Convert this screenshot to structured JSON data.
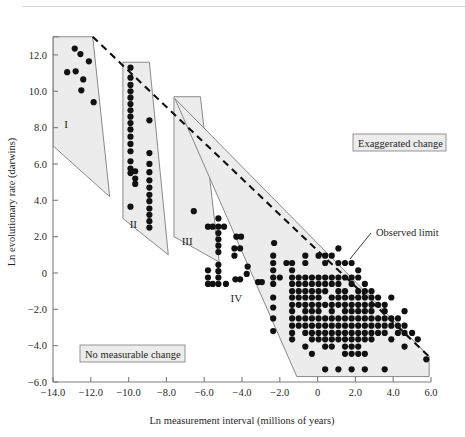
{
  "figure": {
    "name": "evolutionary-rate-vs-measurement-interval-scatter"
  },
  "chart_data": {
    "type": "scatter",
    "title": "",
    "xlabel": "Ln measurement interval (millions of years)",
    "ylabel": "Ln evolutionary rate (darwins)",
    "xlim": [
      -14.0,
      6.0
    ],
    "ylim": [
      -6.0,
      13.0
    ],
    "xticks": [
      -14.0,
      -12.0,
      -10.0,
      -8.0,
      -6.0,
      -4.0,
      -2.0,
      0,
      2.0,
      4.0,
      6.0
    ],
    "xticklabels": [
      "−14.0",
      "−12.0",
      "−10.0",
      "−8.0",
      "−6.0",
      "−4.0",
      "−2.0",
      "0",
      "2.0",
      "4.0",
      "6.0"
    ],
    "yticks": [
      -6.0,
      -4.0,
      -2.0,
      0,
      2.0,
      4.0,
      6.0,
      8.0,
      10.0,
      12.0
    ],
    "yticklabels": [
      "−6.0",
      "−4.0",
      "−2.0",
      "0",
      "2.0",
      "4.0",
      "6.0",
      "8.0",
      "10.0",
      "12.0"
    ],
    "grid": false,
    "legend": false,
    "marker": "filled-circle",
    "marker_color": "#111111",
    "marker_size": 3.1,
    "observed_limit_line": {
      "label": "Observed limit",
      "style": "dashed",
      "from": [
        -11.9,
        13.0
      ],
      "to": [
        5.9,
        -4.6
      ]
    },
    "annotations": [
      {
        "name": "exaggerated-change",
        "text": "Exaggerated change",
        "boxed": true
      },
      {
        "name": "no-measurable-change",
        "text": "No measurable change",
        "boxed": true
      },
      {
        "name": "observed-limit",
        "text": "Observed limit",
        "boxed": false
      }
    ],
    "regions": [
      {
        "label": "I",
        "fill": "#ececec",
        "polygon": [
          [
            -14.0,
            13.0
          ],
          [
            -11.9,
            13.0
          ],
          [
            -11.0,
            4.2
          ],
          [
            -14.0,
            7.0
          ]
        ]
      },
      {
        "label": "II",
        "fill": "#ececec",
        "polygon": [
          [
            -10.3,
            11.6
          ],
          [
            -8.9,
            11.6
          ],
          [
            -7.9,
            1.0
          ],
          [
            -10.3,
            3.0
          ]
        ]
      },
      {
        "label": "III",
        "fill": "#ececec",
        "polygon": [
          [
            -7.6,
            9.7
          ],
          [
            -6.2,
            9.7
          ],
          [
            -5.2,
            0.6
          ],
          [
            -7.6,
            2.0
          ]
        ]
      },
      {
        "label": "IV",
        "fill": "#ececec",
        "polygon": [
          [
            -7.55,
            9.6
          ],
          [
            5.9,
            -4.6
          ],
          [
            5.9,
            -5.7
          ],
          [
            -1.1,
            -5.7
          ]
        ]
      }
    ],
    "series": [
      {
        "name": "region I",
        "points": [
          [
            -12.85,
            12.35
          ],
          [
            -12.55,
            12.05
          ],
          [
            -12.1,
            11.65
          ],
          [
            -13.25,
            11.05
          ],
          [
            -12.8,
            11.1
          ],
          [
            -12.4,
            10.65
          ],
          [
            -12.5,
            10.05
          ],
          [
            -11.85,
            9.4
          ]
        ]
      },
      {
        "name": "region II column a",
        "points": [
          [
            -9.9,
            11.3
          ],
          [
            -9.9,
            10.75
          ],
          [
            -9.9,
            10.35
          ],
          [
            -9.9,
            10.0
          ],
          [
            -9.9,
            9.65
          ],
          [
            -9.9,
            9.3
          ],
          [
            -9.9,
            8.95
          ],
          [
            -9.9,
            8.6
          ],
          [
            -9.9,
            8.25
          ],
          [
            -9.9,
            7.9
          ],
          [
            -9.9,
            7.5
          ],
          [
            -9.9,
            7.1
          ],
          [
            -9.9,
            6.7
          ],
          [
            -9.9,
            6.15
          ],
          [
            -9.9,
            5.75
          ],
          [
            -9.9,
            5.5
          ],
          [
            -9.65,
            5.6
          ],
          [
            -9.65,
            5.2
          ],
          [
            -9.65,
            4.9
          ],
          [
            -9.9,
            3.65
          ]
        ]
      },
      {
        "name": "region II column b",
        "points": [
          [
            -8.9,
            8.4
          ],
          [
            -8.9,
            6.6
          ],
          [
            -8.9,
            6.0
          ],
          [
            -8.9,
            5.55
          ],
          [
            -8.9,
            5.1
          ],
          [
            -8.9,
            4.7
          ],
          [
            -8.9,
            4.3
          ],
          [
            -8.9,
            3.95
          ],
          [
            -8.9,
            3.55
          ],
          [
            -8.9,
            3.2
          ],
          [
            -8.9,
            2.85
          ],
          [
            -8.9,
            2.5
          ]
        ]
      },
      {
        "name": "region III",
        "points": [
          [
            -6.55,
            3.4
          ],
          [
            -5.25,
            3.0
          ],
          [
            -5.8,
            2.55
          ],
          [
            -5.55,
            2.55
          ],
          [
            -5.25,
            2.55
          ],
          [
            -4.95,
            2.55
          ],
          [
            -5.25,
            2.2
          ],
          [
            -5.25,
            1.85
          ],
          [
            -5.25,
            1.5
          ],
          [
            -5.25,
            1.15
          ],
          [
            -5.25,
            0.45
          ],
          [
            -5.25,
            0.1
          ],
          [
            -5.25,
            -0.25
          ],
          [
            -5.8,
            -0.25
          ],
          [
            -5.55,
            -0.6
          ],
          [
            -5.25,
            -0.6
          ],
          [
            -5.8,
            -0.6
          ],
          [
            -4.85,
            -0.6
          ],
          [
            -5.8,
            0.15
          ]
        ]
      },
      {
        "name": "region IV scatter",
        "points": [
          [
            -4.3,
            2.0
          ],
          [
            -4.05,
            2.0
          ],
          [
            -4.4,
            1.35
          ],
          [
            -4.1,
            1.35
          ],
          [
            -4.4,
            0.95
          ],
          [
            -3.7,
            0.35
          ],
          [
            -3.75,
            -0.05
          ],
          [
            -4.35,
            -0.35
          ],
          [
            -4.1,
            -0.35
          ],
          [
            -3.15,
            -0.5
          ],
          [
            -2.95,
            -0.5
          ],
          [
            -2.3,
            1.65
          ],
          [
            -2.35,
            0.95
          ],
          [
            -2.35,
            0.55
          ],
          [
            -2.35,
            0.15
          ],
          [
            -2.35,
            -0.25
          ],
          [
            -2.35,
            -0.6
          ],
          [
            -2.35,
            -1.35
          ],
          [
            -2.35,
            -1.9
          ],
          [
            -2.35,
            -2.5
          ],
          [
            -2.35,
            -3.2
          ],
          [
            -2.0,
            -0.25
          ],
          [
            -1.65,
            0.55
          ],
          [
            -1.35,
            0.55
          ],
          [
            -1.35,
            0.15
          ],
          [
            -1.35,
            -0.25
          ],
          [
            -1.35,
            -0.6
          ],
          [
            -1.35,
            -1.0
          ],
          [
            -1.35,
            -1.35
          ],
          [
            -1.35,
            -1.75
          ],
          [
            -1.35,
            -2.1
          ],
          [
            -1.35,
            -2.5
          ],
          [
            -1.35,
            -2.9
          ],
          [
            -1.35,
            -3.3
          ],
          [
            -1.35,
            -3.65
          ],
          [
            -1.0,
            -0.25
          ],
          [
            -1.0,
            -0.6
          ],
          [
            -1.0,
            -1.0
          ],
          [
            -1.0,
            -1.35
          ],
          [
            -1.0,
            -1.75
          ],
          [
            -1.0,
            -2.5
          ],
          [
            -1.0,
            -2.9
          ],
          [
            -0.65,
            0.95
          ],
          [
            -0.65,
            0.55
          ],
          [
            -0.65,
            -0.25
          ],
          [
            -0.65,
            -0.6
          ],
          [
            -0.65,
            -1.0
          ],
          [
            -0.65,
            -1.35
          ],
          [
            -0.65,
            -1.75
          ],
          [
            -0.65,
            -2.1
          ],
          [
            -0.65,
            -2.5
          ],
          [
            -0.65,
            -2.9
          ],
          [
            -0.65,
            -3.3
          ],
          [
            -0.65,
            -4.05
          ],
          [
            -0.3,
            -0.25
          ],
          [
            -0.3,
            -0.6
          ],
          [
            -0.3,
            -1.0
          ],
          [
            -0.3,
            -1.35
          ],
          [
            -0.3,
            -1.75
          ],
          [
            -0.3,
            -2.1
          ],
          [
            -0.3,
            -2.5
          ],
          [
            -0.3,
            -2.9
          ],
          [
            -0.3,
            -3.3
          ],
          [
            -0.3,
            -3.65
          ],
          [
            -0.3,
            -4.45
          ],
          [
            0.05,
            0.95
          ],
          [
            0.05,
            -0.25
          ],
          [
            0.05,
            -0.6
          ],
          [
            0.05,
            -1.0
          ],
          [
            0.05,
            -1.35
          ],
          [
            0.05,
            -1.75
          ],
          [
            0.05,
            -2.1
          ],
          [
            0.05,
            -2.5
          ],
          [
            0.05,
            -2.9
          ],
          [
            0.05,
            -3.3
          ],
          [
            0.05,
            -3.65
          ],
          [
            0.4,
            0.95
          ],
          [
            0.4,
            0.55
          ],
          [
            0.4,
            -0.25
          ],
          [
            0.4,
            -0.6
          ],
          [
            0.4,
            -1.0
          ],
          [
            0.4,
            -1.75
          ],
          [
            0.4,
            -2.5
          ],
          [
            0.4,
            -2.9
          ],
          [
            0.4,
            -3.3
          ],
          [
            0.4,
            -3.65
          ],
          [
            0.4,
            -4.05
          ],
          [
            0.4,
            -5.3
          ],
          [
            0.75,
            0.95
          ],
          [
            0.75,
            -0.25
          ],
          [
            0.75,
            -0.6
          ],
          [
            0.75,
            -1.35
          ],
          [
            0.75,
            -1.75
          ],
          [
            0.75,
            -2.1
          ],
          [
            0.75,
            -2.5
          ],
          [
            0.75,
            -2.9
          ],
          [
            0.75,
            -3.3
          ],
          [
            0.75,
            -3.65
          ],
          [
            0.75,
            -4.05
          ],
          [
            1.1,
            1.35
          ],
          [
            1.1,
            0.55
          ],
          [
            1.1,
            -0.25
          ],
          [
            1.1,
            -0.6
          ],
          [
            1.1,
            -1.0
          ],
          [
            1.1,
            -1.35
          ],
          [
            1.1,
            -1.75
          ],
          [
            1.1,
            -2.5
          ],
          [
            1.1,
            -2.9
          ],
          [
            1.1,
            -3.3
          ],
          [
            1.1,
            -3.65
          ],
          [
            1.1,
            -5.3
          ],
          [
            1.45,
            0.55
          ],
          [
            1.45,
            -0.25
          ],
          [
            1.45,
            -1.0
          ],
          [
            1.45,
            -1.35
          ],
          [
            1.45,
            -1.75
          ],
          [
            1.45,
            -2.1
          ],
          [
            1.45,
            -2.5
          ],
          [
            1.45,
            -2.9
          ],
          [
            1.45,
            -3.3
          ],
          [
            1.45,
            -3.65
          ],
          [
            1.45,
            -4.05
          ],
          [
            1.45,
            -4.45
          ],
          [
            1.8,
            0.55
          ],
          [
            1.8,
            -0.25
          ],
          [
            1.8,
            -0.6
          ],
          [
            1.8,
            -1.35
          ],
          [
            1.8,
            -1.75
          ],
          [
            1.8,
            -2.1
          ],
          [
            1.8,
            -2.5
          ],
          [
            1.8,
            -2.9
          ],
          [
            1.8,
            -3.3
          ],
          [
            1.8,
            -3.65
          ],
          [
            1.8,
            -4.05
          ],
          [
            1.8,
            -4.45
          ],
          [
            1.8,
            -5.3
          ],
          [
            2.15,
            0.15
          ],
          [
            2.15,
            -0.25
          ],
          [
            2.15,
            -1.0
          ],
          [
            2.15,
            -1.35
          ],
          [
            2.15,
            -1.75
          ],
          [
            2.15,
            -2.1
          ],
          [
            2.15,
            -2.5
          ],
          [
            2.15,
            -2.9
          ],
          [
            2.15,
            -3.3
          ],
          [
            2.15,
            -3.65
          ],
          [
            2.15,
            -4.05
          ],
          [
            2.15,
            -4.45
          ],
          [
            2.5,
            -0.6
          ],
          [
            2.5,
            -1.0
          ],
          [
            2.5,
            -1.35
          ],
          [
            2.5,
            -1.75
          ],
          [
            2.5,
            -2.1
          ],
          [
            2.5,
            -2.5
          ],
          [
            2.5,
            -2.9
          ],
          [
            2.5,
            -3.3
          ],
          [
            2.5,
            -3.65
          ],
          [
            2.5,
            -4.45
          ],
          [
            2.5,
            -5.3
          ],
          [
            2.85,
            -1.0
          ],
          [
            2.85,
            -1.35
          ],
          [
            2.85,
            -1.75
          ],
          [
            2.85,
            -2.1
          ],
          [
            2.85,
            -2.5
          ],
          [
            2.85,
            -2.9
          ],
          [
            2.85,
            -3.3
          ],
          [
            2.85,
            -3.65
          ],
          [
            3.2,
            -1.35
          ],
          [
            3.2,
            -1.75
          ],
          [
            3.2,
            -2.5
          ],
          [
            3.2,
            -2.9
          ],
          [
            3.2,
            -3.3
          ],
          [
            3.55,
            -1.75
          ],
          [
            3.55,
            -2.1
          ],
          [
            3.55,
            -2.5
          ],
          [
            3.55,
            -2.9
          ],
          [
            3.55,
            -3.3
          ],
          [
            3.55,
            -5.3
          ],
          [
            3.9,
            -1.35
          ],
          [
            3.9,
            -2.5
          ],
          [
            3.9,
            -2.9
          ],
          [
            3.9,
            -3.65
          ],
          [
            4.25,
            -2.5
          ],
          [
            4.25,
            -2.9
          ],
          [
            4.25,
            -3.3
          ],
          [
            4.6,
            -2.1
          ],
          [
            4.6,
            -2.9
          ],
          [
            4.6,
            -3.3
          ],
          [
            4.6,
            -4.05
          ],
          [
            5.0,
            -3.3
          ],
          [
            5.3,
            -3.65
          ],
          [
            5.75,
            -4.75
          ]
        ]
      }
    ]
  }
}
